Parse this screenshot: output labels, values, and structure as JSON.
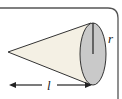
{
  "figure": {
    "labels": {
      "radius": "r",
      "length": "l"
    },
    "colors": {
      "cone_fill": "#f4f0e4",
      "base_fill": "#c9c9c9",
      "stroke": "#333333",
      "frame": "#555555"
    }
  }
}
